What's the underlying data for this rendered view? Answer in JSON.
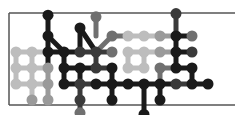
{
  "image": {
    "title": "Molecular dot pattern graphic",
    "background": "#ffffff",
    "frame": {
      "color": "#555555",
      "left_x": 9,
      "top_y": 13,
      "bottom_y": 105,
      "right_x": 235,
      "stroke": 1.5
    },
    "palette": {
      "black": "#1a1a1a",
      "dark": "#3a3a3a",
      "mid": "#707070",
      "grey": "#9a9a9a",
      "light": "#bdbdbd"
    },
    "grid": {
      "origin_x": 16,
      "origin_y": 20,
      "step": 16,
      "dot_radius": 5.5,
      "link_width": 5
    },
    "dots": [
      {
        "c": 2,
        "r": -0.3,
        "t": "black"
      },
      {
        "c": 5,
        "r": -0.2,
        "t": "mid"
      },
      {
        "c": 10,
        "r": -0.4,
        "t": "dark"
      },
      {
        "c": 2,
        "r": 1,
        "t": "black"
      },
      {
        "c": 4,
        "r": 0.5,
        "t": "black"
      },
      {
        "c": 6,
        "r": 1,
        "t": "mid"
      },
      {
        "c": 7,
        "r": 1,
        "t": "light"
      },
      {
        "c": 8,
        "r": 1,
        "t": "light"
      },
      {
        "c": 9,
        "r": 1,
        "t": "grey"
      },
      {
        "c": 10,
        "r": 1,
        "t": "black"
      },
      {
        "c": 11,
        "r": 1,
        "t": "mid"
      },
      {
        "c": 0,
        "r": 2,
        "t": "light"
      },
      {
        "c": 1,
        "r": 2,
        "t": "light"
      },
      {
        "c": 2,
        "r": 2,
        "t": "black"
      },
      {
        "c": 3,
        "r": 2,
        "t": "black"
      },
      {
        "c": 4,
        "r": 2,
        "t": "dark"
      },
      {
        "c": 5,
        "r": 2,
        "t": "dark"
      },
      {
        "c": 6,
        "r": 2,
        "t": "mid"
      },
      {
        "c": 7,
        "r": 2,
        "t": "light"
      },
      {
        "c": 8,
        "r": 2,
        "t": "light"
      },
      {
        "c": 9,
        "r": 2,
        "t": "grey"
      },
      {
        "c": 10,
        "r": 2,
        "t": "black"
      },
      {
        "c": 11,
        "r": 2,
        "t": "dark"
      },
      {
        "c": 0,
        "r": 3,
        "t": "light"
      },
      {
        "c": 1,
        "r": 3,
        "t": "light"
      },
      {
        "c": 2,
        "r": 3,
        "t": "grey"
      },
      {
        "c": 3,
        "r": 3,
        "t": "black"
      },
      {
        "c": 4,
        "r": 3,
        "t": "black"
      },
      {
        "c": 5,
        "r": 3,
        "t": "dark"
      },
      {
        "c": 6,
        "r": 3,
        "t": "black"
      },
      {
        "c": 7,
        "r": 3,
        "t": "light"
      },
      {
        "c": 8,
        "r": 3,
        "t": "light"
      },
      {
        "c": 9,
        "r": 3,
        "t": "mid"
      },
      {
        "c": 10,
        "r": 3,
        "t": "black"
      },
      {
        "c": 11,
        "r": 3,
        "t": "black"
      },
      {
        "c": 0,
        "r": 4,
        "t": "light"
      },
      {
        "c": 1,
        "r": 4,
        "t": "light"
      },
      {
        "c": 2,
        "r": 4,
        "t": "grey"
      },
      {
        "c": 3,
        "r": 4,
        "t": "black"
      },
      {
        "c": 4,
        "r": 4,
        "t": "dark"
      },
      {
        "c": 5,
        "r": 4,
        "t": "black"
      },
      {
        "c": 6,
        "r": 4,
        "t": "black"
      },
      {
        "c": 7,
        "r": 4,
        "t": "black"
      },
      {
        "c": 8,
        "r": 4,
        "t": "black"
      },
      {
        "c": 9,
        "r": 4,
        "t": "black"
      },
      {
        "c": 10,
        "r": 4,
        "t": "dark"
      },
      {
        "c": 11,
        "r": 4,
        "t": "black"
      },
      {
        "c": 12,
        "r": 4,
        "t": "black"
      },
      {
        "c": 1,
        "r": 5,
        "t": "grey"
      },
      {
        "c": 2,
        "r": 5,
        "t": "grey"
      },
      {
        "c": 4,
        "r": 5,
        "t": "dark"
      },
      {
        "c": 6,
        "r": 5,
        "t": "black"
      },
      {
        "c": 9,
        "r": 5,
        "t": "black"
      },
      {
        "c": 4,
        "r": 5.8,
        "t": "mid"
      },
      {
        "c": 8,
        "r": 5.9,
        "t": "black"
      }
    ],
    "links": [
      [
        2,
        -0.3,
        2,
        1
      ],
      [
        5,
        -0.2,
        5,
        1
      ],
      [
        10,
        -0.4,
        10,
        1
      ],
      [
        2,
        1,
        3,
        2
      ],
      [
        2,
        1,
        2,
        2
      ],
      [
        4,
        0.5,
        4,
        2
      ],
      [
        4,
        0.5,
        5,
        2
      ],
      [
        6,
        1,
        5,
        2
      ],
      [
        6,
        1,
        7,
        1
      ],
      [
        7,
        1,
        8,
        1
      ],
      [
        8,
        1,
        9,
        1
      ],
      [
        9,
        1,
        10,
        1
      ],
      [
        10,
        1,
        11,
        1
      ],
      [
        10,
        1,
        10,
        2
      ],
      [
        0,
        2,
        1,
        2
      ],
      [
        1,
        2,
        2,
        2
      ],
      [
        2,
        2,
        3,
        2
      ],
      [
        3,
        2,
        4,
        2
      ],
      [
        4,
        2,
        5,
        2
      ],
      [
        5,
        2,
        6,
        2
      ],
      [
        7,
        2,
        8,
        2
      ],
      [
        8,
        2,
        9,
        2
      ],
      [
        9,
        2,
        10,
        2
      ],
      [
        10,
        2,
        11,
        2
      ],
      [
        0,
        2,
        0,
        3
      ],
      [
        1,
        2,
        1,
        3
      ],
      [
        2,
        2,
        2,
        3
      ],
      [
        3,
        2,
        3,
        3
      ],
      [
        5,
        2,
        5,
        3
      ],
      [
        7,
        2,
        7,
        3
      ],
      [
        8,
        2,
        8,
        3
      ],
      [
        10,
        2,
        10,
        3
      ],
      [
        0,
        3,
        1,
        3
      ],
      [
        1,
        3,
        2,
        3
      ],
      [
        3,
        3,
        4,
        3
      ],
      [
        4,
        3,
        5,
        3
      ],
      [
        5,
        3,
        6,
        3
      ],
      [
        7,
        3,
        8,
        3
      ],
      [
        9,
        3,
        10,
        3
      ],
      [
        10,
        3,
        11,
        3
      ],
      [
        0,
        3,
        0,
        4
      ],
      [
        1,
        3,
        1,
        4
      ],
      [
        2,
        3,
        2,
        4
      ],
      [
        3,
        3,
        3,
        4
      ],
      [
        4,
        3,
        4,
        4
      ],
      [
        6,
        3,
        6,
        4
      ],
      [
        9,
        3,
        9,
        4
      ],
      [
        11,
        3,
        11,
        4
      ],
      [
        0,
        4,
        1,
        4
      ],
      [
        1,
        4,
        2,
        4
      ],
      [
        3,
        4,
        4,
        4
      ],
      [
        4,
        4,
        5,
        4
      ],
      [
        5,
        4,
        6,
        4
      ],
      [
        6,
        4,
        7,
        4
      ],
      [
        7,
        4,
        8,
        4
      ],
      [
        8,
        4,
        9,
        4
      ],
      [
        9,
        4,
        10,
        4
      ],
      [
        10,
        4,
        11,
        4
      ],
      [
        11,
        4,
        12,
        4
      ],
      [
        1,
        4,
        1,
        5
      ],
      [
        2,
        4,
        2,
        5
      ],
      [
        4,
        4,
        4,
        5
      ],
      [
        6,
        4,
        6,
        5
      ],
      [
        9,
        4,
        9,
        5
      ],
      [
        4,
        5,
        4,
        5.8
      ],
      [
        8,
        4,
        8,
        5.9
      ]
    ]
  }
}
